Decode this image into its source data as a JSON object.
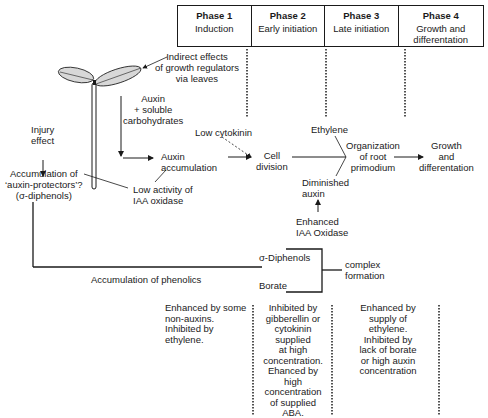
{
  "phases": [
    {
      "title": "Phase 1",
      "subtitle": "Induction"
    },
    {
      "title": "Phase 2",
      "subtitle": "Early initiation"
    },
    {
      "title": "Phase 3",
      "subtitle": "Late initiation"
    },
    {
      "title": "Phase 4",
      "subtitle": "Growth and differentation"
    }
  ],
  "labels": {
    "indirect_effects": [
      "Indirect effects",
      "of growth regulators",
      "via leaves"
    ],
    "auxin_carbs": [
      "Auxin",
      "+ soluble",
      "carbohydrates"
    ],
    "injury_effect": [
      "Injury",
      "effect"
    ],
    "auxin_protectors": [
      "Accumulation of",
      "‘auxin-protectors’?",
      "(σ-diphenols)"
    ],
    "auxin_accumulation": [
      "Auxin",
      "accumulation"
    ],
    "low_iaa": [
      "Low activity of",
      "IAA oxidase"
    ],
    "low_cytokinin": "Low cytokinin",
    "cell_division": [
      "Cell",
      "division"
    ],
    "ethylene": "Ethylene",
    "organization": [
      "Organization",
      "of root",
      "primodium"
    ],
    "growth": [
      "Growth",
      "and",
      "differentation"
    ],
    "diminished_auxin": [
      "Diminished",
      "auxin"
    ],
    "enhanced_iaa": [
      "Enhanced",
      "IAA Oxidase"
    ],
    "o_diphenols": "σ-Diphenols",
    "borate": "Borate",
    "complex_formation": [
      "complex",
      "formation"
    ],
    "accumulation_phenolics": "Accumulation of phenolics"
  },
  "notes": {
    "phase1": [
      "Enhanced by some",
      "non-auxins.",
      "Inhibited by",
      "ethylene."
    ],
    "phase2": [
      "Inhibited by",
      "gibberellin or",
      "cytokinin",
      "supplied",
      "at high",
      "concentration.",
      "Ehanced by",
      "high",
      "concentration",
      "of supplied",
      "ABA."
    ],
    "phase3": [
      "Enhanced by",
      "supply of",
      "ethylene.",
      "Inhibited by",
      "lack of borate",
      "or high auxin",
      "concentration"
    ]
  }
}
